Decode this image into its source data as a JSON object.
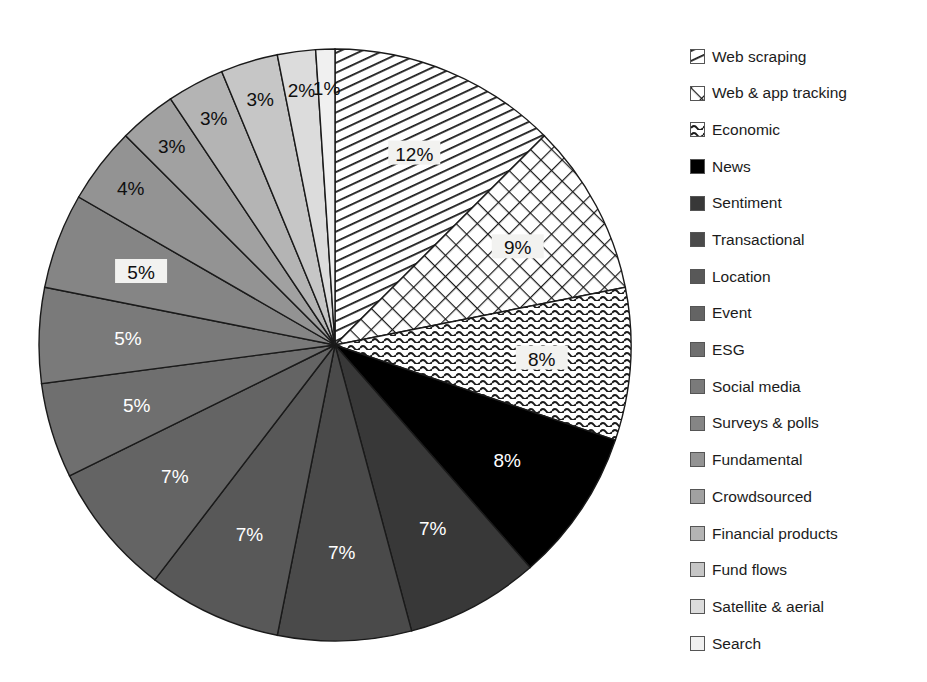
{
  "chart_data": {
    "type": "pie",
    "title": "",
    "subtitle": "",
    "xlabel": "",
    "ylabel": "",
    "legend_position": "right",
    "grid": false,
    "start_angle_deg": 0,
    "direction": "clockwise",
    "categories": [
      "Web scraping",
      "Web & app tracking",
      "Economic",
      "News",
      "Sentiment",
      "Transactional",
      "Location",
      "Event",
      "ESG",
      "Social media",
      "Surveys & polls",
      "Fundamental",
      "Crowdsourced",
      "Financial products",
      "Fund flows",
      "Satellite & aerial",
      "Search"
    ],
    "values": [
      12,
      9,
      8,
      8,
      7,
      7,
      7,
      7,
      5,
      5,
      5,
      4,
      3,
      3,
      3,
      2,
      1
    ],
    "value_labels": [
      "12%",
      "9%",
      "8%",
      "8%",
      "7%",
      "7%",
      "7%",
      "7%",
      "5%",
      "5%",
      "5%",
      "4%",
      "3%",
      "3%",
      "3%",
      "2%",
      "1%"
    ],
    "unit": "%",
    "fills": [
      "diagonal-stripes",
      "crosshatch-diamond",
      "wavy-lines",
      "#000000",
      "#383838",
      "#4a4a4a",
      "#585858",
      "#646464",
      "#6f6f6f",
      "#7a7a7a",
      "#858585",
      "#939393",
      "#a1a1a1",
      "#b4b4b4",
      "#c6c6c6",
      "#dcdcdc",
      "#f0f0f0"
    ],
    "label_text_colors": [
      "dark",
      "dark",
      "dark",
      "light",
      "light",
      "light",
      "light",
      "light",
      "light",
      "light",
      "dark",
      "dark",
      "dark",
      "dark",
      "dark",
      "dark",
      "dark"
    ]
  },
  "legend": {
    "items": [
      {
        "label": "Web scraping",
        "swatch": "diagonal-stripes"
      },
      {
        "label": "Web & app tracking",
        "swatch": "crosshatch-diamond"
      },
      {
        "label": "Economic",
        "swatch": "wavy-lines"
      },
      {
        "label": "News",
        "swatch": "#000000"
      },
      {
        "label": "Sentiment",
        "swatch": "#383838"
      },
      {
        "label": "Transactional",
        "swatch": "#4a4a4a"
      },
      {
        "label": "Location",
        "swatch": "#585858"
      },
      {
        "label": "Event",
        "swatch": "#646464"
      },
      {
        "label": "ESG",
        "swatch": "#6f6f6f"
      },
      {
        "label": "Social media",
        "swatch": "#7a7a7a"
      },
      {
        "label": "Surveys & polls",
        "swatch": "#858585"
      },
      {
        "label": "Fundamental",
        "swatch": "#939393"
      },
      {
        "label": "Crowdsourced",
        "swatch": "#a1a1a1"
      },
      {
        "label": "Financial products",
        "swatch": "#b4b4b4"
      },
      {
        "label": "Fund flows",
        "swatch": "#c6c6c6"
      },
      {
        "label": "Satellite & aerial",
        "swatch": "#dcdcdc"
      },
      {
        "label": "Search",
        "swatch": "#f0f0f0"
      }
    ]
  },
  "geometry": {
    "center_x": 335,
    "center_y": 345,
    "radius": 296
  }
}
